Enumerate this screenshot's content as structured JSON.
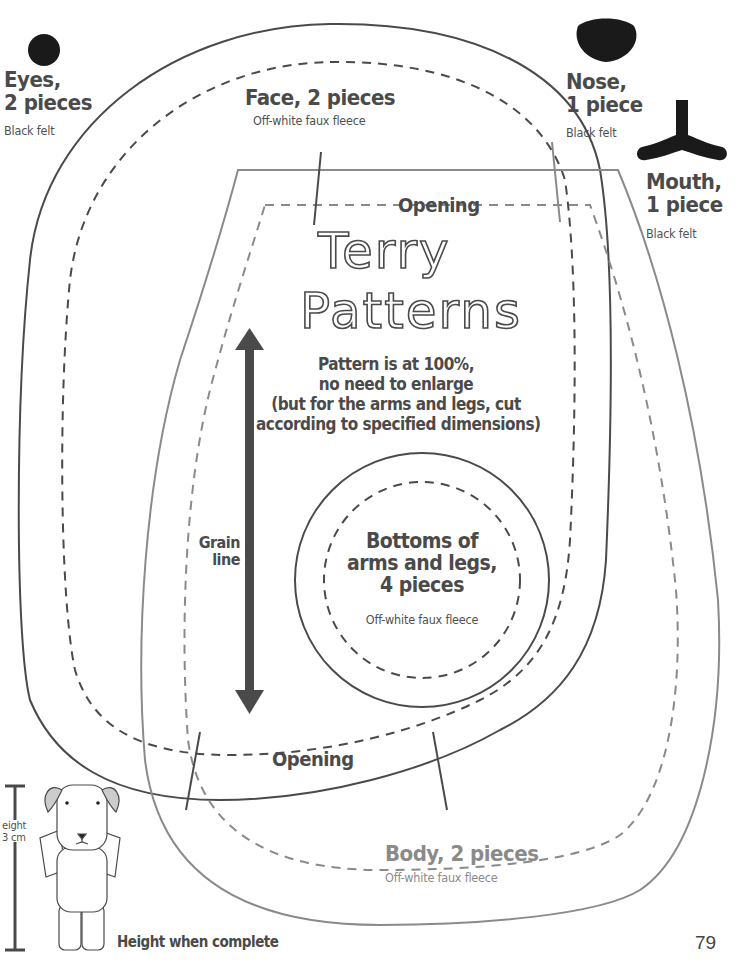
{
  "pieces": {
    "eyes": {
      "name": "Eyes,",
      "count": "2 pieces",
      "material": "Black felt"
    },
    "face": {
      "name": "Face, 2 pieces",
      "material": "Off-white faux fleece"
    },
    "nose": {
      "name": "Nose,",
      "count": "1 piece",
      "material": "Black felt"
    },
    "mouth": {
      "name": "Mouth,",
      "count": "1 piece",
      "material": "Black felt"
    },
    "limb_bottoms": {
      "line1": "Bottoms of",
      "line2": "arms and legs,",
      "line3": "4 pieces",
      "material": "Off-white faux fleece"
    },
    "body": {
      "name": "Body, 2 pieces",
      "material": "Off-white faux fleece"
    }
  },
  "markers": {
    "opening_top": "Opening",
    "opening_bottom": "Opening",
    "grain_line_1": "Grain",
    "grain_line_2": "line"
  },
  "title": {
    "line1": "Terry",
    "line2": "Patterns"
  },
  "notes": {
    "line1": "Pattern is at 100%,",
    "line2": "no need to enlarge",
    "line3": "(but for the arms and legs, cut",
    "line4": "according to specified dimensions)"
  },
  "height_ref": {
    "label_partial_1": "eight",
    "label_partial_2": "3 cm",
    "caption": "Height when complete"
  },
  "page_number": "79",
  "colors": {
    "ink": "#4a4a4a",
    "body_outline": "#8a8a8a",
    "felt": "#1a1a1a"
  }
}
